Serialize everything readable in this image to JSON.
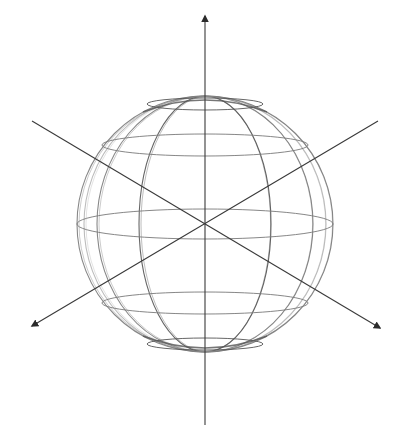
{
  "diagram": {
    "canvas": {
      "width": 411,
      "height": 437,
      "background": "#ffffff"
    },
    "colors": {
      "axis": "#3a3a3a",
      "grid_dark": "#555555",
      "grid_mid": "#7a7a7a",
      "grid_light": "#b5b5b5",
      "arrowhead": "#2b2b2b"
    },
    "sphere": {
      "center": [
        205,
        224
      ],
      "radius": 128,
      "latitudes": [
        {
          "y": 104,
          "rx": 58,
          "ry": 6
        },
        {
          "y": 145,
          "rx": 103,
          "ry": 11
        },
        {
          "y": 224,
          "rx": 128,
          "ry": 15
        },
        {
          "y": 303,
          "rx": 103,
          "ry": 11
        },
        {
          "y": 344,
          "rx": 58,
          "ry": 6
        }
      ],
      "meridians": [
        {
          "rx": 0
        },
        {
          "rx": 66
        },
        {
          "rx": 108
        },
        {
          "rx": 121
        },
        {
          "rx": 128
        }
      ]
    },
    "axes": [
      {
        "name": "vertical-axis",
        "x1": 205,
        "y1": 425,
        "x2": 205,
        "y2": 16,
        "arrow": "end"
      },
      {
        "name": "diagonal-axis-a",
        "x1": 32,
        "y1": 121,
        "x2": 380,
        "y2": 328,
        "arrow": "end"
      },
      {
        "name": "diagonal-axis-b",
        "x1": 378,
        "y1": 121,
        "x2": 32,
        "y2": 326,
        "arrow": "end"
      }
    ]
  }
}
